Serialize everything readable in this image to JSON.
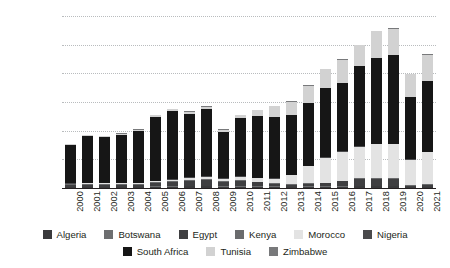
{
  "chart_data": {
    "type": "bar",
    "stacked": true,
    "title": "",
    "xlabel": "",
    "ylabel": "Number of Vehicles",
    "ylim": [
      0,
      1200000
    ],
    "ytick_labels": [
      "0",
      "200 000",
      "400 000",
      "600 000",
      "800 000",
      "1 000 000",
      "1 200 000"
    ],
    "ytick_values": [
      0,
      200000,
      400000,
      600000,
      800000,
      1000000,
      1200000
    ],
    "grid": true,
    "legend_position": "bottom",
    "categories": [
      "2000",
      "2001",
      "2002",
      "2003",
      "2004",
      "2005",
      "2006",
      "2007",
      "2008",
      "2009",
      "2010",
      "2011",
      "2012",
      "2013",
      "2014",
      "2015",
      "2016",
      "2017",
      "2018",
      "2019",
      "2020",
      "2021"
    ],
    "series": [
      {
        "name": "Algeria",
        "color": "#3a3a3c",
        "values": [
          6000,
          6000,
          6000,
          6000,
          6000,
          9000,
          10000,
          11000,
          11000,
          9000,
          9000,
          9000,
          8000,
          7000,
          8000,
          9000,
          10000,
          11000,
          11000,
          11000,
          5000,
          6000
        ]
      },
      {
        "name": "Botswana",
        "color": "#6d6e70",
        "values": [
          3000,
          3000,
          3000,
          3000,
          3000,
          4000,
          4000,
          4000,
          4000,
          4000,
          4000,
          4000,
          4000,
          3000,
          4000,
          4000,
          4000,
          4000,
          4000,
          4000,
          2000,
          3000
        ]
      },
      {
        "name": "Egypt",
        "color": "#3f3f41",
        "values": [
          14000,
          14000,
          14000,
          14000,
          15000,
          22000,
          29000,
          37000,
          40000,
          29000,
          39000,
          27000,
          18000,
          12000,
          17000,
          20000,
          32000,
          45000,
          48000,
          46000,
          8000,
          12000
        ]
      },
      {
        "name": "Kenya",
        "color": "#6a6b6d",
        "values": [
          3000,
          3000,
          3000,
          3000,
          3000,
          4000,
          5000,
          6000,
          6000,
          5000,
          6000,
          5000,
          5000,
          4000,
          5000,
          5000,
          6000,
          7000,
          7000,
          7000,
          3000,
          4000
        ]
      },
      {
        "name": "Morocco",
        "color": "#e3e3e3",
        "values": [
          5000,
          6000,
          6000,
          6000,
          7000,
          9000,
          11000,
          14000,
          16000,
          16000,
          19000,
          23000,
          31000,
          62000,
          119000,
          172000,
          200000,
          221000,
          234000,
          237000,
          180000,
          226000
        ]
      },
      {
        "name": "Nigeria",
        "color": "#4a4a4c",
        "values": [
          3000,
          3000,
          3000,
          3000,
          3000,
          4000,
          4000,
          4000,
          4000,
          4000,
          4000,
          4000,
          4000,
          4000,
          4000,
          4000,
          4000,
          5000,
          5000,
          5000,
          2000,
          3000
        ]
      },
      {
        "name": "South Africa",
        "color": "#161616",
        "values": [
          265000,
          325000,
          321000,
          337000,
          363000,
          445000,
          473000,
          440000,
          468000,
          327000,
          410000,
          432000,
          425000,
          420000,
          440000,
          487000,
          475000,
          560000,
          600000,
          619000,
          437000,
          490000
        ]
      },
      {
        "name": "Tunisia",
        "color": "#d2d2d2",
        "values": [
          6000,
          7000,
          7000,
          7000,
          8000,
          11000,
          13000,
          15000,
          17000,
          13000,
          16000,
          39000,
          75000,
          90000,
          116000,
          127000,
          165000,
          142000,
          185000,
          184000,
          158000,
          186000
        ]
      },
      {
        "name": "Zimbabwe",
        "color": "#78797b",
        "values": [
          3000,
          3000,
          3000,
          3000,
          3000,
          4000,
          4000,
          4000,
          4000,
          4000,
          4000,
          4000,
          4000,
          3000,
          4000,
          4000,
          4000,
          5000,
          5000,
          5000,
          2000,
          3000
        ]
      }
    ],
    "totals": [
      308000,
      370000,
      366000,
      382000,
      411000,
      512000,
      553000,
      535000,
      570000,
      411000,
      511000,
      547000,
      574000,
      605000,
      717000,
      832000,
      900000,
      1000000,
      1099000,
      1118000,
      797000,
      933000
    ]
  }
}
